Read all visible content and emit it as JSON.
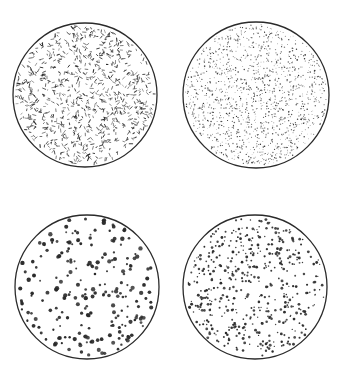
{
  "figure": {
    "width": 339,
    "height": 373,
    "background": "#ffffff",
    "ink": "#2a2a2a",
    "panels": [
      {
        "id": "top-left",
        "cx": 85,
        "cy": 95,
        "r": 72,
        "style": "dashes",
        "density": 900,
        "mark_size": 1.0,
        "seed": 11
      },
      {
        "id": "top-right",
        "cx": 256,
        "cy": 95,
        "r": 73,
        "style": "fine-stipple",
        "density": 1400,
        "mark_size": 0.6,
        "seed": 23
      },
      {
        "id": "bottom-left",
        "cx": 87,
        "cy": 287,
        "r": 72,
        "style": "large-dots",
        "density": 230,
        "mark_size": 1.7,
        "seed": 37
      },
      {
        "id": "bottom-right",
        "cx": 255,
        "cy": 287,
        "r": 72,
        "style": "small-dots",
        "density": 480,
        "mark_size": 1.15,
        "seed": 53
      }
    ]
  }
}
